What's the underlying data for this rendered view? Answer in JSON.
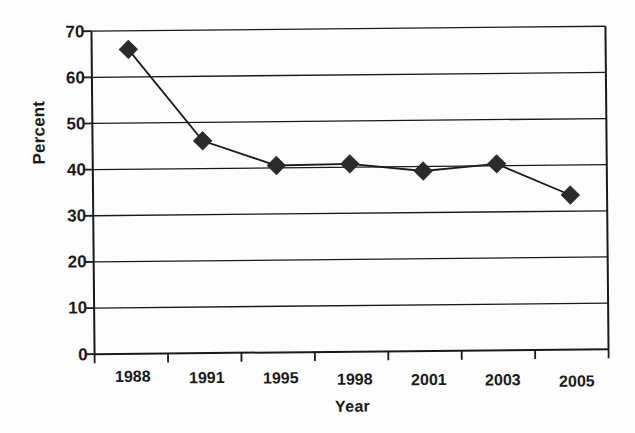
{
  "chart_data": {
    "type": "line",
    "title": "",
    "xlabel": "Year",
    "ylabel": "Percent",
    "categories": [
      "1988",
      "1991",
      "1995",
      "1998",
      "2001",
      "2003",
      "2005"
    ],
    "values": [
      66,
      46,
      40.5,
      40.7,
      39,
      40.4,
      33.5
    ],
    "series": [
      {
        "name": "Percent",
        "values": [
          66,
          46,
          40.5,
          40.7,
          39,
          40.4,
          33.5
        ]
      }
    ],
    "ylim": [
      0,
      70
    ],
    "ytick_labels": [
      "0",
      "10",
      "20",
      "30",
      "40",
      "50",
      "60",
      "70"
    ],
    "ytick_values": [
      0,
      10,
      20,
      30,
      40,
      50,
      60,
      70
    ],
    "grid": "horizontal",
    "legend": "none",
    "marker": "diamond",
    "marker_color": "#2b2b2b",
    "line_color": "#1a1a1a",
    "axis_color": "#1a1a1a",
    "background_color": "#ffffff"
  }
}
